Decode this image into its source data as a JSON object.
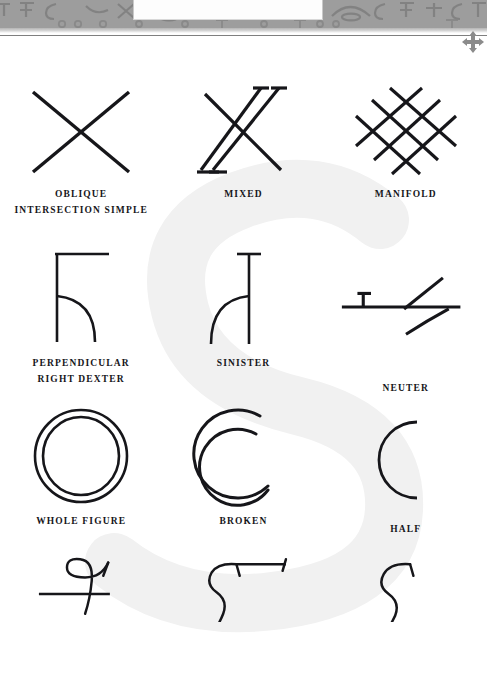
{
  "page": {
    "type": "printed-glossary-page",
    "background_color": "#ffffff",
    "ink_color": "#16161a"
  },
  "header": {
    "band_color": "#9d9d9d",
    "ornament_name": "ornamental-glyph-frieze",
    "white_panel_name": "header-white-panel",
    "rule_color": "#7f7f7f"
  },
  "toolbar": {
    "move_icon": "move-arrows-icon",
    "move_icon_color": "#8b8b8b"
  },
  "watermark": {
    "glyph": "S",
    "color": "#f2f2f2"
  },
  "figures": {
    "rows": [
      {
        "row_index": 0,
        "cells": [
          {
            "id": "oblique-intersection-simple",
            "label": "OBLIQUE\nINTERSECTION SIMPLE",
            "shape": "x-cross-simple"
          },
          {
            "id": "mixed",
            "label": "MIXED",
            "shape": "x-cross-doubled-serif"
          },
          {
            "id": "manifold",
            "label": "MANIFOLD",
            "shape": "lattice-triple-diagonals"
          }
        ]
      },
      {
        "row_index": 1,
        "cells": [
          {
            "id": "perpendicular-right-dexter",
            "label": "PERPENDICULAR\nRIGHT DEXTER",
            "shape": "stem-top-arm-arc-right"
          },
          {
            "id": "sinister",
            "label": "SINISTER",
            "shape": "stem-serif-arc-left"
          },
          {
            "id": "neuter",
            "label": "NEUTER",
            "shape": "horizontal-bar-with-tick-and-flourish"
          }
        ]
      },
      {
        "row_index": 2,
        "cells": [
          {
            "id": "whole-figure",
            "label": "WHOLE FIGURE",
            "shape": "concentric-circles"
          },
          {
            "id": "broken",
            "label": "BROKEN",
            "shape": "double-open-crescent"
          },
          {
            "id": "half",
            "label": "HALF",
            "shape": "left-half-arc"
          }
        ]
      },
      {
        "row_index": 3,
        "cells": [
          {
            "id": "s-curve-crossed",
            "label": "",
            "shape": "s-curve-crossed-by-bar"
          },
          {
            "id": "s-curve-with-bar",
            "label": "",
            "shape": "s-curve-with-top-bar"
          },
          {
            "id": "s-curve-plain",
            "label": "",
            "shape": "s-curve-plain-hook"
          }
        ]
      }
    ]
  }
}
